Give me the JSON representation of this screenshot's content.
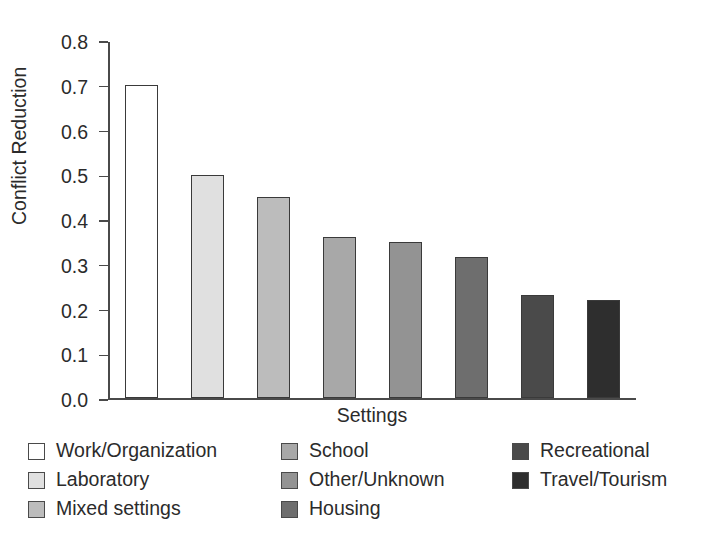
{
  "chart_data": {
    "type": "bar",
    "title": "",
    "subtitle": "",
    "xlabel": "Settings",
    "ylabel": "Conflict Reduction",
    "ylim": [
      0.0,
      0.8
    ],
    "ytick_labels": [
      "0.0",
      "0.1",
      "0.2",
      "0.3",
      "0.4",
      "0.5",
      "0.6",
      "0.7",
      "0.8"
    ],
    "ytick_values": [
      0.0,
      0.1,
      0.2,
      0.3,
      0.4,
      0.5,
      0.6,
      0.7,
      0.8
    ],
    "xtick_labels": [],
    "grid": false,
    "legend_position": "bottom",
    "categories": [
      "Work/Organization",
      "Laboratory",
      "Mixed settings",
      "School",
      "Other/Unknown",
      "Housing",
      "Recreational",
      "Travel/Tourism"
    ],
    "values": [
      0.7,
      0.5,
      0.45,
      0.36,
      0.35,
      0.315,
      0.23,
      0.22
    ],
    "bar_colors": [
      "#ffffff",
      "#e0e0e0",
      "#bcbcbc",
      "#a8a8a8",
      "#939393",
      "#6e6e6e",
      "#4a4a4a",
      "#2e2e2e"
    ],
    "bar_edge_color": "#3a3a3a",
    "axis_color": "#4a4a4a",
    "text_color": "#2b2b2b",
    "background_color": "#ffffff"
  },
  "legend": {
    "columns": [
      {
        "items": [
          {
            "label": "Work/Organization",
            "color": "#ffffff"
          },
          {
            "label": "Laboratory",
            "color": "#e0e0e0"
          },
          {
            "label": "Mixed settings",
            "color": "#bcbcbc"
          }
        ]
      },
      {
        "items": [
          {
            "label": "School",
            "color": "#a8a8a8"
          },
          {
            "label": "Other/Unknown",
            "color": "#939393"
          },
          {
            "label": "Housing",
            "color": "#6e6e6e"
          }
        ]
      },
      {
        "items": [
          {
            "label": "Recreational",
            "color": "#4a4a4a"
          },
          {
            "label": "Travel/Tourism",
            "color": "#2e2e2e"
          }
        ]
      }
    ]
  }
}
